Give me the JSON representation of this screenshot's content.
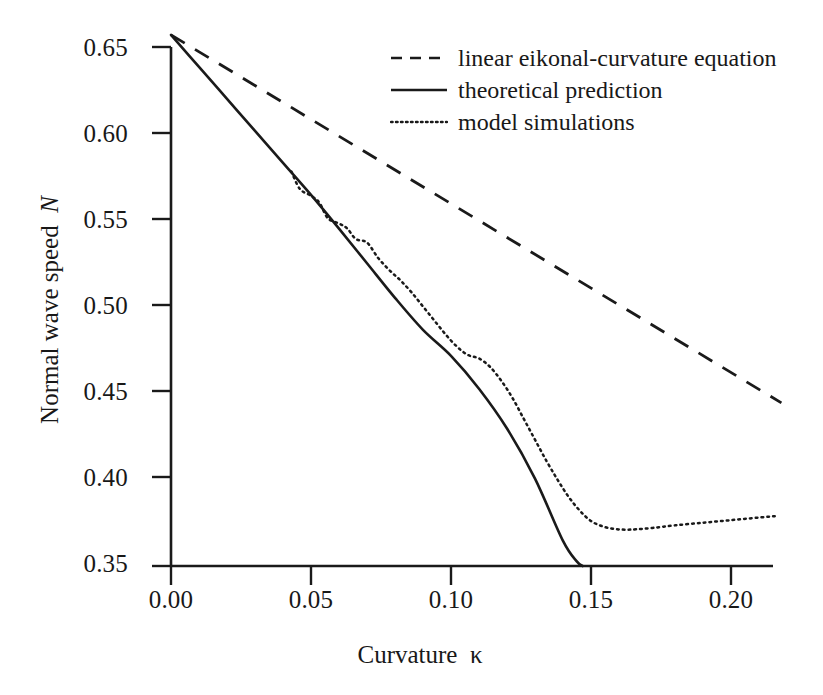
{
  "figure": {
    "background": "#ffffff",
    "ink_color": "#1a1a1a"
  },
  "axes": {
    "x_title_text": "Curvature",
    "x_title_symbol": "κ",
    "y_title_text": "Normal wave speed",
    "y_title_symbol": "N",
    "x_ticks": [
      "0.00",
      "0.05",
      "0.10",
      "0.15",
      "0.20"
    ],
    "y_ticks": [
      "0.65",
      "0.60",
      "0.55",
      "0.50",
      "0.45",
      "0.40",
      "0.35"
    ]
  },
  "legend": {
    "items": [
      {
        "label": "linear eikonal-curvature equation",
        "style": "dashed",
        "icon": "dashed-line-icon"
      },
      {
        "label": "theoretical prediction",
        "style": "solid",
        "icon": "solid-line-icon"
      },
      {
        "label": "model simulations",
        "style": "dotted",
        "icon": "dotted-line-icon"
      }
    ]
  },
  "chart_data": {
    "type": "line",
    "title": "",
    "xlabel": "Curvature κ",
    "ylabel": "Normal wave speed N",
    "xlim": [
      0.0,
      0.22
    ],
    "ylim": [
      0.35,
      0.66
    ],
    "grid": false,
    "legend_position": "upper-right-inside",
    "series": [
      {
        "name": "linear eikonal-curvature equation",
        "style": "dashed",
        "x": [
          0.0,
          0.02,
          0.04,
          0.06,
          0.08,
          0.1,
          0.12,
          0.14,
          0.16,
          0.18,
          0.2,
          0.218
        ],
        "y": [
          0.657,
          0.6375,
          0.618,
          0.5985,
          0.579,
          0.5595,
          0.54,
          0.5205,
          0.501,
          0.4815,
          0.462,
          0.4443
        ]
      },
      {
        "name": "theoretical prediction",
        "style": "solid",
        "x": [
          0.0,
          0.01,
          0.02,
          0.03,
          0.04,
          0.05,
          0.06,
          0.07,
          0.08,
          0.09,
          0.1,
          0.11,
          0.12,
          0.13,
          0.14,
          0.145,
          0.147
        ],
        "y": [
          0.657,
          0.6385,
          0.62,
          0.6015,
          0.583,
          0.5645,
          0.545,
          0.525,
          0.505,
          0.4865,
          0.4715,
          0.4525,
          0.4295,
          0.4005,
          0.3645,
          0.3525,
          0.35
        ]
      },
      {
        "name": "model simulations",
        "style": "dotted",
        "x": [
          0.043,
          0.046,
          0.05,
          0.053,
          0.056,
          0.06,
          0.063,
          0.066,
          0.07,
          0.074,
          0.078,
          0.082,
          0.086,
          0.09,
          0.094,
          0.098,
          0.102,
          0.106,
          0.11,
          0.114,
          0.118,
          0.122,
          0.126,
          0.13,
          0.134,
          0.138,
          0.142,
          0.146,
          0.15,
          0.154,
          0.158,
          0.162,
          0.166,
          0.172,
          0.18,
          0.19,
          0.2,
          0.21,
          0.217
        ],
        "y": [
          0.578,
          0.568,
          0.564,
          0.56,
          0.551,
          0.548,
          0.545,
          0.539,
          0.537,
          0.528,
          0.521,
          0.515,
          0.508,
          0.5,
          0.492,
          0.484,
          0.477,
          0.472,
          0.47,
          0.465,
          0.457,
          0.447,
          0.435,
          0.423,
          0.411,
          0.4,
          0.39,
          0.382,
          0.376,
          0.373,
          0.3715,
          0.371,
          0.3712,
          0.372,
          0.3735,
          0.375,
          0.3765,
          0.378,
          0.379
        ]
      }
    ],
    "annotations": {
      "crossing_point": {
        "x": 0.105,
        "y": 0.471,
        "note": "theoretical prediction crosses model simulations"
      },
      "simulation_minimum": {
        "x": 0.162,
        "y": 0.371
      },
      "common_origin": {
        "x": 0.0,
        "y": 0.657
      }
    }
  }
}
